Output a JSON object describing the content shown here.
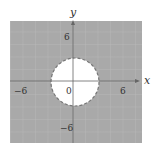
{
  "graph": {
    "title": "",
    "x_axis_label": "x",
    "y_axis_label": "y",
    "tick_labels": {
      "x_neg": "−6",
      "x_pos": "6",
      "y_pos": "6",
      "y_neg": "−6",
      "origin": "0"
    },
    "shaded_region": "outside circle",
    "circle": {
      "center": [
        0,
        0
      ],
      "radius": 3,
      "boundary": "dashed"
    },
    "colors": {
      "shade": "#a9a9a9",
      "grid": "#bdbdbd",
      "axis": "#666666",
      "background": "#ffffff"
    }
  }
}
